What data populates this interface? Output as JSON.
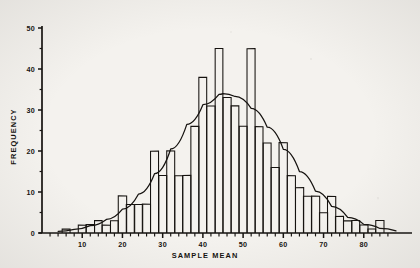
{
  "figure": {
    "background_color": "#f4f2ee",
    "ink_color": "#15120f"
  },
  "chart_data": {
    "type": "bar",
    "title": "",
    "subtitle": "",
    "xlabel": "SAMPLE MEAN",
    "ylabel": "FREQUENCY",
    "xlim": [
      0,
      90
    ],
    "ylim": [
      0,
      50
    ],
    "grid": false,
    "legend": null,
    "x_major_ticks": [
      10,
      20,
      30,
      40,
      50,
      60,
      70,
      80
    ],
    "x_tick_labels": [
      "10",
      "20",
      "30",
      "40",
      "50",
      "60",
      "70",
      "80"
    ],
    "x_minor_tick_step": 2,
    "y_major_ticks": [
      0,
      10,
      20,
      30,
      40,
      50
    ],
    "y_tick_labels": [
      "0",
      "10",
      "20",
      "30",
      "40",
      "50"
    ],
    "y_minor_ticks": [
      5,
      15,
      25,
      35,
      45
    ],
    "bar_width": 2,
    "categories": [
      6,
      8,
      10,
      12,
      14,
      16,
      18,
      20,
      22,
      24,
      26,
      28,
      30,
      32,
      34,
      36,
      38,
      40,
      42,
      44,
      46,
      48,
      50,
      52,
      54,
      56,
      58,
      60,
      62,
      64,
      66,
      68,
      70,
      72,
      74,
      76,
      78,
      80,
      82,
      84
    ],
    "values": [
      1,
      0,
      2,
      2,
      3,
      2,
      3,
      9,
      7,
      7,
      7,
      20,
      14,
      20,
      14,
      14,
      26,
      38,
      31,
      45,
      33,
      31,
      26,
      45,
      26,
      22,
      16,
      22,
      14,
      11,
      9,
      9,
      5,
      9,
      4,
      3,
      3,
      2,
      1,
      3
    ],
    "series": [
      {
        "name": "Normal curve",
        "type": "line",
        "mean": 45,
        "peak_value": 34,
        "std_dev": 13.5,
        "x": [
          4,
          8,
          12,
          16,
          20,
          24,
          28,
          32,
          36,
          40,
          44,
          45,
          48,
          52,
          56,
          60,
          64,
          68,
          72,
          76,
          80,
          84,
          88
        ],
        "y": [
          0.4,
          0.9,
          1.8,
          3.3,
          5.8,
          9.5,
          14.5,
          20.5,
          26.5,
          31.3,
          33.8,
          34.0,
          33.3,
          30.4,
          25.8,
          20.4,
          15.0,
          10.2,
          6.5,
          3.8,
          2.1,
          1.1,
          0.5
        ]
      }
    ]
  }
}
